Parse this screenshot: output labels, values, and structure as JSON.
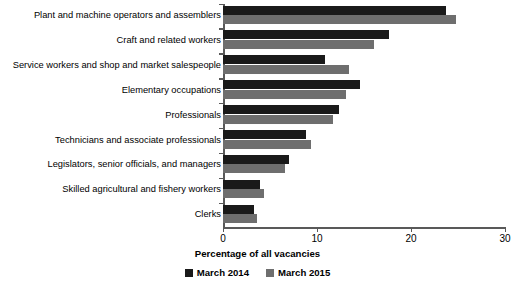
{
  "chart_data": {
    "type": "bar",
    "orientation": "horizontal",
    "title": "",
    "xlabel": "Percentage of all vacancies",
    "ylabel": "",
    "xlim": [
      0,
      30
    ],
    "xticks": [
      0,
      10,
      20,
      30
    ],
    "xtick_labels": [
      "0",
      "10",
      "20",
      "30"
    ],
    "grid": false,
    "legend_position": "bottom",
    "categories": [
      "Plant and machine operators and assemblers",
      "Craft and related workers",
      "Service workers and shop and market salespeople",
      "Elementary occupations",
      "Professionals",
      "Technicians and associate professionals",
      "Legislators, senior officials, and managers",
      "Skilled agricultural and fishery workers",
      "Clerks"
    ],
    "series": [
      {
        "name": "March 2014",
        "color": "#1a1a1a",
        "values": [
          23.7,
          17.7,
          10.8,
          14.6,
          12.3,
          8.8,
          7.0,
          3.9,
          3.3
        ]
      },
      {
        "name": "March 2015",
        "color": "#6e6e6e",
        "values": [
          24.8,
          16.1,
          13.4,
          13.1,
          11.7,
          9.4,
          6.6,
          4.4,
          3.6
        ]
      }
    ]
  },
  "legend": {
    "items": [
      {
        "label": "March 2014",
        "color": "#1a1a1a"
      },
      {
        "label": "March 2015",
        "color": "#6e6e6e"
      }
    ]
  },
  "axis": {
    "x_title": "Percentage of all vacancies"
  }
}
